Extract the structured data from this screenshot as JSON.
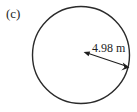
{
  "figure": {
    "panel_label": "(c)",
    "background_color": "#ffffff",
    "stroke_color": "#2a2a2a",
    "dimension_color": "#1e1e1e",
    "shape": {
      "kind": "circle",
      "center_x": 81,
      "center_y": 55,
      "radius_px": 49
    },
    "dimension": {
      "label": "4.98 m",
      "value": "4.98",
      "unit": "m",
      "measures": "radius",
      "arrow_style": "double-headed",
      "start_x": 84,
      "start_y": 52,
      "end_x": 129,
      "end_y": 67,
      "label_x": 92,
      "label_y": 52
    }
  }
}
